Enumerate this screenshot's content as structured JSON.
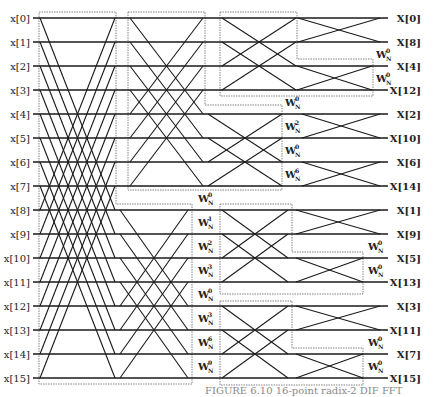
{
  "inputs": [
    "x[0]",
    "x[1]",
    "x[2]",
    "x[3]",
    "x[4]",
    "x[5]",
    "x[6]",
    "x[7]",
    "x[8]",
    "x[9]",
    "x[10]",
    "x[11]",
    "x[12]",
    "x[13]",
    "x[14]",
    "x[15]"
  ],
  "outputs": [
    "X[0]",
    "X[8]",
    "X[4]",
    "X[12]",
    "X[2]",
    "X[10]",
    "X[6]",
    "X[14]",
    "X[1]",
    "X[9]",
    "X[5]",
    "X[13]",
    "X[3]",
    "X[11]",
    "X[7]",
    "X[15]"
  ],
  "twiddle_base": "W",
  "twiddle_sub": "N",
  "stage1_twiddles": {
    "x": 198,
    "items": [
      {
        "row": 7.5,
        "exp": "0"
      },
      {
        "row": 8.5,
        "exp": "1"
      },
      {
        "row": 9.5,
        "exp": "2"
      },
      {
        "row": 10.5,
        "exp": "3"
      },
      {
        "row": 11.5,
        "exp": "0"
      },
      {
        "row": 12.5,
        "exp": "3"
      },
      {
        "row": 13.5,
        "exp": "6"
      },
      {
        "row": 14.5,
        "exp": "9"
      }
    ]
  },
  "stage2_twiddles": {
    "x": 285,
    "items": [
      {
        "row": 3.5,
        "exp": "0"
      },
      {
        "row": 4.5,
        "exp": "2"
      },
      {
        "row": 5.5,
        "exp": "0"
      },
      {
        "row": 6.5,
        "exp": "6"
      }
    ]
  },
  "stage3_twiddles": [
    {
      "x": 376,
      "row": 1.5,
      "exp": "0"
    },
    {
      "x": 376,
      "row": 2.5,
      "exp": "0"
    },
    {
      "x": 368,
      "row": 9.5,
      "exp": "0"
    },
    {
      "x": 368,
      "row": 10.5,
      "exp": "0"
    },
    {
      "x": 368,
      "row": 13.5,
      "exp": "0"
    },
    {
      "x": 368,
      "row": 14.5,
      "exp": "0"
    }
  ],
  "caption": "FIGURE 6.10  16-point radix-2 DIF FFT",
  "colors": {
    "line": "#1a1a1a",
    "box": "#666666"
  }
}
